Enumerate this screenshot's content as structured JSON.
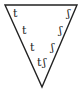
{
  "diagram": {
    "shape": "inverted-triangle",
    "stroke_color": "#222222",
    "background": "#ffffff",
    "left_labels": [
      {
        "text": "t",
        "x": 13,
        "y": 17
      },
      {
        "text": "t",
        "x": 22,
        "y": 34
      },
      {
        "text": "t",
        "x": 30,
        "y": 51
      },
      {
        "text": "t",
        "x": 37,
        "y": 66
      }
    ],
    "right_labels": [
      {
        "text": "ʃ",
        "x": 67,
        "y": 17
      },
      {
        "text": "ʃ",
        "x": 59,
        "y": 34
      },
      {
        "text": "ʃ",
        "x": 51,
        "y": 51
      },
      {
        "text": "ʃ",
        "x": 43,
        "y": 66
      }
    ]
  }
}
